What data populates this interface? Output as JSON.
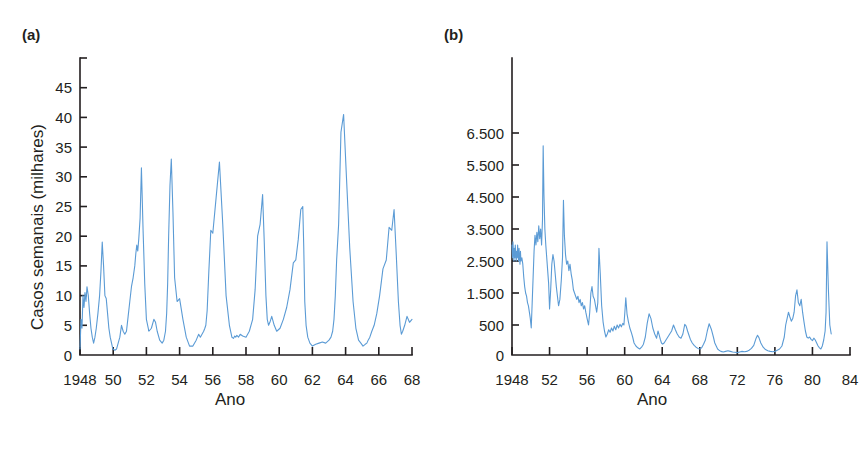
{
  "figure": {
    "background_color": "#ffffff",
    "text_color": "#231f20",
    "series_color": "#5b9bd5"
  },
  "panels": [
    {
      "id": "a",
      "label": "(a)",
      "xlabel": "Ano",
      "ylabel": "Casos semanais (milhares)"
    },
    {
      "id": "b",
      "label": "(b)",
      "xlabel": "Ano",
      "ylabel": "Casos"
    }
  ],
  "chart_data": [
    {
      "type": "line",
      "panel": "a",
      "title": "(a)",
      "xlabel": "Ano",
      "ylabel": "Casos semanais (milhares)",
      "grid": false,
      "legend": null,
      "xlim": [
        1948,
        1968
      ],
      "ylim": [
        0,
        50
      ],
      "xticks": [
        1948,
        1950,
        1952,
        1954,
        1956,
        1958,
        1960,
        1962,
        1964,
        1966,
        1968
      ],
      "xticklabels": [
        "1948",
        "50",
        "52",
        "54",
        "56",
        "58",
        "60",
        "62",
        "64",
        "66",
        "68"
      ],
      "yticks": [
        0,
        5,
        10,
        15,
        20,
        25,
        30,
        35,
        40,
        45
      ],
      "yticklabels": [
        "0",
        "5",
        "10",
        "15",
        "20",
        "25",
        "30",
        "35",
        "40",
        "45"
      ],
      "x": [
        1948.0,
        1948.06,
        1948.12,
        1948.18,
        1948.24,
        1948.3,
        1948.36,
        1948.42,
        1948.5,
        1948.58,
        1948.66,
        1948.74,
        1948.82,
        1948.9,
        1948.98,
        1949.08,
        1949.18,
        1949.26,
        1949.34,
        1949.42,
        1949.5,
        1949.58,
        1949.66,
        1949.74,
        1949.82,
        1949.9,
        1949.98,
        1950.1,
        1950.2,
        1950.3,
        1950.4,
        1950.5,
        1950.6,
        1950.7,
        1950.8,
        1950.9,
        1951.0,
        1951.1,
        1951.2,
        1951.3,
        1951.36,
        1951.42,
        1951.48,
        1951.54,
        1951.62,
        1951.7,
        1951.8,
        1951.9,
        1952.0,
        1952.15,
        1952.3,
        1952.45,
        1952.55,
        1952.65,
        1952.8,
        1952.95,
        1953.05,
        1953.15,
        1953.22,
        1953.28,
        1953.34,
        1953.42,
        1953.5,
        1953.6,
        1953.7,
        1953.85,
        1954.0,
        1954.2,
        1954.4,
        1954.6,
        1954.8,
        1955.0,
        1955.15,
        1955.25,
        1955.35,
        1955.45,
        1955.52,
        1955.58,
        1955.66,
        1955.76,
        1955.88,
        1956.0,
        1956.2,
        1956.4,
        1956.6,
        1956.8,
        1957.0,
        1957.15,
        1957.25,
        1957.32,
        1957.38,
        1957.45,
        1957.55,
        1957.65,
        1957.8,
        1958.0,
        1958.2,
        1958.4,
        1958.55,
        1958.7,
        1958.85,
        1959.0,
        1959.1,
        1959.2,
        1959.28,
        1959.36,
        1959.44,
        1959.55,
        1959.7,
        1959.85,
        1960.05,
        1960.25,
        1960.45,
        1960.65,
        1960.85,
        1961.0,
        1961.15,
        1961.3,
        1961.42,
        1961.48,
        1961.54,
        1961.62,
        1961.72,
        1961.85,
        1962.0,
        1962.2,
        1962.4,
        1962.6,
        1962.8,
        1963.0,
        1963.12,
        1963.22,
        1963.3,
        1963.38,
        1963.46,
        1963.58,
        1963.72,
        1963.88,
        1964.05,
        1964.25,
        1964.45,
        1964.62,
        1964.78,
        1964.92,
        1965.05,
        1965.18,
        1965.28,
        1965.36,
        1965.46,
        1965.58,
        1965.72,
        1965.88,
        1966.05,
        1966.25,
        1966.45,
        1966.62,
        1966.78,
        1966.92,
        1967.05,
        1967.18,
        1967.28,
        1967.36,
        1967.44,
        1967.56,
        1967.7,
        1967.85,
        1968.0
      ],
      "y": [
        1.0,
        6.0,
        4.5,
        10.0,
        8.0,
        10.5,
        9.0,
        11.5,
        10.0,
        7.0,
        4.5,
        3.0,
        2.0,
        3.0,
        4.5,
        7.0,
        10.0,
        14.0,
        19.0,
        15.0,
        10.0,
        9.5,
        7.0,
        4.5,
        3.0,
        2.0,
        1.0,
        0.8,
        1.0,
        2.0,
        3.0,
        5.0,
        4.0,
        3.5,
        4.0,
        6.5,
        9.0,
        11.5,
        13.0,
        15.0,
        17.0,
        18.5,
        17.5,
        19.5,
        23.0,
        31.5,
        21.0,
        12.0,
        6.0,
        4.0,
        4.5,
        6.0,
        5.5,
        4.0,
        2.5,
        2.0,
        2.5,
        4.0,
        7.0,
        12.0,
        20.0,
        28.5,
        33.0,
        24.0,
        13.0,
        9.0,
        9.5,
        6.0,
        3.0,
        1.5,
        1.5,
        2.5,
        3.5,
        3.0,
        3.5,
        4.0,
        4.5,
        5.0,
        7.5,
        14.0,
        21.0,
        20.5,
        26.5,
        32.5,
        22.0,
        10.0,
        5.0,
        3.0,
        2.8,
        3.2,
        3.0,
        3.3,
        3.0,
        3.5,
        3.2,
        3.0,
        4.0,
        6.0,
        11.0,
        20.0,
        22.0,
        27.0,
        19.0,
        10.0,
        6.0,
        5.0,
        5.5,
        6.5,
        5.0,
        4.0,
        4.5,
        6.0,
        8.0,
        11.0,
        15.5,
        16.0,
        19.5,
        24.5,
        25.0,
        18.0,
        9.0,
        5.0,
        3.0,
        2.0,
        1.5,
        1.8,
        2.0,
        2.2,
        2.0,
        2.5,
        3.0,
        4.0,
        6.0,
        10.0,
        16.0,
        22.0,
        37.5,
        40.5,
        30.0,
        18.0,
        9.0,
        4.5,
        2.5,
        2.0,
        1.5,
        1.8,
        2.0,
        2.5,
        3.0,
        4.0,
        5.0,
        7.0,
        10.0,
        14.5,
        16.0,
        21.5,
        21.0,
        24.5,
        17.0,
        9.0,
        5.0,
        3.5,
        4.0,
        5.0,
        6.5,
        5.5,
        6.0,
        7.5,
        8.0,
        9.5,
        10.0,
        14.0,
        24.5,
        17.0,
        10.0,
        6.5,
        9.5,
        8.5,
        10.0,
        6.5,
        4.5,
        3.5,
        3.0,
        4.0,
        5.5,
        4.5,
        5.5,
        6.0,
        8.5,
        9.5,
        8.5,
        9.5,
        7.5,
        12.0,
        26.5,
        15.0,
        10.0,
        9.0,
        5.0,
        3.0,
        1.5,
        1.0
      ]
    },
    {
      "type": "line",
      "panel": "b",
      "title": "(b)",
      "xlabel": "Ano",
      "ylabel": "Casos",
      "grid": false,
      "legend": null,
      "xlim": [
        1948,
        1984
      ],
      "ylim": [
        0,
        7500
      ],
      "xticks": [
        1948,
        1952,
        1956,
        1960,
        1964,
        1968,
        1972,
        1976,
        1980,
        1984
      ],
      "xticklabels": [
        "1948",
        "52",
        "56",
        "60",
        "64",
        "68",
        "72",
        "76",
        "80",
        "84"
      ],
      "yticks": [
        0,
        500,
        1500,
        2500,
        3500,
        4500,
        5500,
        6500
      ],
      "yticklabels": [
        "0",
        "500",
        "1.500",
        "2.500",
        "3.500",
        "4.500",
        "5.500",
        "6.500"
      ],
      "x": [
        1948.0,
        1948.05,
        1948.1,
        1948.15,
        1948.2,
        1948.25,
        1948.3,
        1948.35,
        1948.4,
        1948.45,
        1948.5,
        1948.55,
        1948.6,
        1948.65,
        1948.7,
        1948.75,
        1948.8,
        1948.85,
        1948.9,
        1948.95,
        1949.05,
        1949.15,
        1949.25,
        1949.35,
        1949.45,
        1949.55,
        1949.65,
        1949.75,
        1949.85,
        1949.95,
        1950.05,
        1950.15,
        1950.25,
        1950.35,
        1950.45,
        1950.55,
        1950.65,
        1950.75,
        1950.85,
        1950.95,
        1951.05,
        1951.15,
        1951.25,
        1951.32,
        1951.4,
        1951.5,
        1951.6,
        1951.7,
        1951.8,
        1951.9,
        1952.0,
        1952.12,
        1952.24,
        1952.36,
        1952.48,
        1952.6,
        1952.72,
        1952.84,
        1952.96,
        1953.1,
        1953.25,
        1953.38,
        1953.48,
        1953.58,
        1953.7,
        1953.82,
        1953.94,
        1954.06,
        1954.18,
        1954.3,
        1954.42,
        1954.54,
        1954.66,
        1954.78,
        1954.9,
        1955.02,
        1955.14,
        1955.26,
        1955.38,
        1955.5,
        1955.62,
        1955.74,
        1955.86,
        1956.0,
        1956.15,
        1956.28,
        1956.4,
        1956.52,
        1956.64,
        1956.78,
        1956.9,
        1957.02,
        1957.14,
        1957.26,
        1957.4,
        1957.55,
        1957.7,
        1957.85,
        1958.0,
        1958.15,
        1958.3,
        1958.45,
        1958.6,
        1958.75,
        1958.9,
        1959.05,
        1959.2,
        1959.35,
        1959.5,
        1959.65,
        1959.8,
        1959.92,
        1960.02,
        1960.12,
        1960.25,
        1960.4,
        1960.55,
        1960.7,
        1960.85,
        1961.0,
        1961.2,
        1961.4,
        1961.6,
        1961.8,
        1962.0,
        1962.2,
        1962.4,
        1962.6,
        1962.8,
        1963.0,
        1963.2,
        1963.4,
        1963.55,
        1963.68,
        1963.8,
        1963.92,
        1964.05,
        1964.2,
        1964.4,
        1964.6,
        1964.8,
        1965.0,
        1965.2,
        1965.4,
        1965.6,
        1965.8,
        1966.0,
        1966.2,
        1966.4,
        1966.55,
        1966.7,
        1966.85,
        1967.0,
        1967.2,
        1967.4,
        1967.6,
        1967.8,
        1968.0,
        1968.2,
        1968.4,
        1968.6,
        1968.8,
        1969.0,
        1969.25,
        1969.45,
        1969.6,
        1969.75,
        1969.9,
        1970.05,
        1970.25,
        1970.5,
        1970.75,
        1971.0,
        1971.25,
        1971.5,
        1971.75,
        1972.0,
        1972.25,
        1972.5,
        1972.75,
        1973.0,
        1973.25,
        1973.5,
        1973.75,
        1974.0,
        1974.15,
        1974.3,
        1974.5,
        1974.75,
        1975.0,
        1975.25,
        1975.5,
        1975.75,
        1976.0,
        1976.25,
        1976.5,
        1976.75,
        1977.0,
        1977.15,
        1977.3,
        1977.45,
        1977.6,
        1977.75,
        1977.9,
        1978.05,
        1978.2,
        1978.35,
        1978.5,
        1978.65,
        1978.8,
        1978.95,
        1979.1,
        1979.25,
        1979.4,
        1979.55,
        1979.7,
        1979.85,
        1980.0,
        1980.15,
        1980.3,
        1980.45,
        1980.6,
        1980.75,
        1980.9,
        1981.05,
        1981.2,
        1981.35,
        1981.45,
        1981.55,
        1981.7,
        1981.85,
        1982.0
      ],
      "y": [
        3000,
        2600,
        3100,
        2800,
        2500,
        2900,
        2600,
        3000,
        2700,
        2500,
        2800,
        2600,
        3000,
        2700,
        2500,
        2900,
        2600,
        2400,
        2800,
        2500,
        2600,
        2400,
        2000,
        1700,
        1500,
        1400,
        1200,
        1100,
        900,
        700,
        450,
        1200,
        2000,
        2800,
        3300,
        3000,
        3400,
        3100,
        3600,
        3200,
        3500,
        3000,
        3800,
        6100,
        4600,
        3500,
        3000,
        2600,
        2200,
        1800,
        1000,
        1600,
        2400,
        2700,
        2500,
        2100,
        1700,
        1400,
        1100,
        1300,
        1900,
        2600,
        4400,
        3300,
        2700,
        2400,
        2500,
        2200,
        2400,
        2100,
        1900,
        1600,
        1500,
        1400,
        1300,
        1400,
        1200,
        1300,
        1100,
        1200,
        1000,
        1100,
        900,
        700,
        500,
        900,
        1500,
        1700,
        1400,
        1300,
        1100,
        900,
        1200,
        2900,
        2100,
        1100,
        600,
        400,
        300,
        350,
        420,
        380,
        450,
        400,
        480,
        420,
        500,
        450,
        520,
        470,
        550,
        500,
        900,
        1350,
        850,
        600,
        450,
        380,
        300,
        200,
        150,
        120,
        100,
        130,
        180,
        300,
        550,
        850,
        700,
        450,
        350,
        280,
        400,
        330,
        260,
        200,
        180,
        200,
        250,
        300,
        350,
        400,
        500,
        420,
        350,
        300,
        280,
        350,
        520,
        480,
        400,
        330,
        260,
        200,
        160,
        130,
        110,
        100,
        120,
        180,
        250,
        400,
        540,
        420,
        300,
        200,
        150,
        100,
        80,
        60,
        50,
        60,
        70,
        60,
        50,
        45,
        40,
        50,
        60,
        55,
        60,
        80,
        110,
        160,
        280,
        330,
        290,
        200,
        130,
        90,
        70,
        60,
        55,
        60,
        80,
        100,
        150,
        300,
        500,
        700,
        900,
        750,
        620,
        700,
        900,
        1400,
        1600,
        1200,
        1100,
        1300,
        900,
        600,
        400,
        300,
        280,
        300,
        260,
        240,
        280,
        250,
        200,
        150,
        120,
        100,
        150,
        250,
        400,
        900,
        3100,
        1600,
        500,
        350
      ]
    }
  ]
}
